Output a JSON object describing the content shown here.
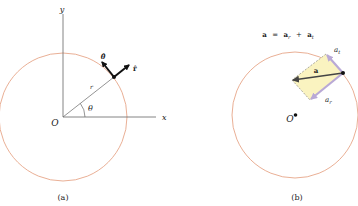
{
  "panel_a": {
    "caption": "(a)",
    "axis_x_label": "x",
    "axis_y_label": "y",
    "origin_label": "O",
    "radius_label": "r",
    "angle_label": "θ",
    "unit_r_label": "r̂",
    "unit_theta_label": "θ̂",
    "circle_color": "#e39a7a"
  },
  "panel_b": {
    "caption": "(b)",
    "equation": {
      "lhs": "a",
      "eq": "=",
      "term1": "a",
      "term1_sub": "r",
      "plus": "+",
      "term2": "a",
      "term2_sub": "t"
    },
    "vector_label": "a",
    "tangential_label": "a",
    "tangential_sub": "t",
    "radial_label": "a",
    "radial_sub": "r",
    "origin_label": "O",
    "circle_color": "#e39a7a",
    "parallelogram_fill": "#faf3c0",
    "component_color": "#b9a9d6"
  }
}
